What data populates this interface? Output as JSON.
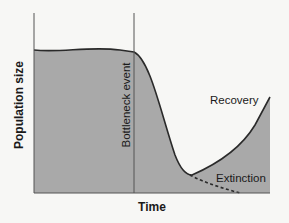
{
  "diagram": {
    "x_axis_label": "Time",
    "y_axis_label": "Population size",
    "annotations": {
      "bottleneck": "Bottleneck event",
      "recovery": "Recovery",
      "extinction": "Extinction"
    },
    "colors": {
      "fill": "#a9a9a9",
      "line": "#2a2a2a",
      "background": "#f7f7f5"
    }
  }
}
